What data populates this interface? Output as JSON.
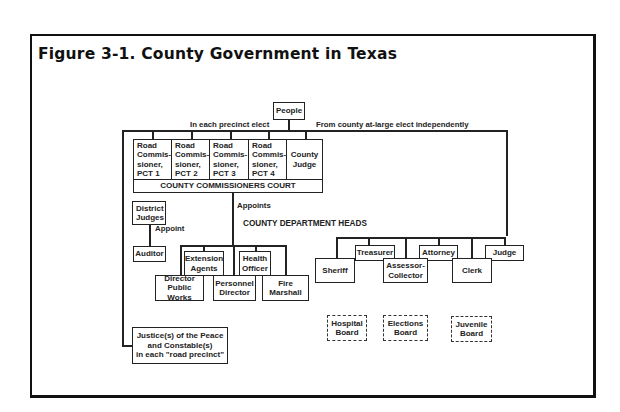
{
  "figure": {
    "title": "Figure 3-1.  County Government in Texas"
  },
  "diagram": {
    "root": "People",
    "labels": {
      "precinct_elect": "In each precinct elect",
      "at_large_elect": "From county at-large elect independently",
      "appoints": "Appoints",
      "appoint": "Appoint",
      "department_heads": "COUNTY DEPARTMENT HEADS"
    },
    "commissioners_court": {
      "label": "COUNTY COMMISSIONERS COURT",
      "members": [
        "Road\nCommis-\nsioner,\nPCT 1",
        "Road\nCommis-\nsioner,\nPCT 2",
        "Road\nCommis-\nsioner,\nPCT 3",
        "Road\nCommis-\nsioner,\nPCT 4",
        "County\nJudge"
      ]
    },
    "judicial": {
      "district_judges": "District\nJudges",
      "auditor": "Auditor",
      "justices": "Justice(s) of the Peace\nand Constable(s)\nin each \"road precinct\""
    },
    "department_heads": {
      "upper": [
        "Extension\nAgents",
        "Health\nOfficer"
      ],
      "lower": [
        "Director\nPublic Works",
        "Personnel\nDirector",
        "Fire\nMarshall"
      ]
    },
    "elected_officials": {
      "upper": [
        "Treasurer",
        "Attorney",
        "Judge"
      ],
      "lower": [
        "Sheriff",
        "Assessor-\nCollector",
        "Clerk"
      ]
    },
    "boards": [
      "Hospital\nBoard",
      "Elections\nBoard",
      "Juvenile\nBoard"
    ]
  }
}
